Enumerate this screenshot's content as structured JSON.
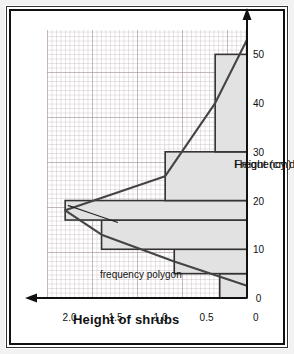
{
  "figure": {
    "title": "Height of shrubs",
    "annotation": "frequency polygon"
  },
  "chart_data": {
    "type": "bar",
    "title": "Height of shrubs",
    "xlabel": "Height (cm)",
    "ylabel": "Frequency density",
    "xlim": [
      0,
      55
    ],
    "ylim": [
      0,
      2.2
    ],
    "xticks": [
      "0",
      "10",
      "20",
      "30",
      "40",
      "50"
    ],
    "xtick_values": [
      0,
      10,
      20,
      30,
      40,
      50
    ],
    "yticks": [
      "0",
      "0.5",
      "1.0",
      "1.5",
      "2.0"
    ],
    "ytick_values": [
      0,
      0.5,
      1.0,
      1.5,
      2.0
    ],
    "grid": true,
    "orientation": "rotated-90-ccw",
    "bars": [
      {
        "label": "0-5",
        "x0": 0,
        "x1": 5,
        "value": 0.3
      },
      {
        "label": "5-10",
        "x0": 5,
        "x1": 10,
        "value": 0.8
      },
      {
        "label": "10-16",
        "x0": 10,
        "x1": 16,
        "value": 1.6
      },
      {
        "label": "16-20",
        "x0": 16,
        "x1": 20,
        "value": 2.0
      },
      {
        "label": "20-30",
        "x0": 20,
        "x1": 30,
        "value": 0.9
      },
      {
        "label": "30-50",
        "x0": 30,
        "x1": 50,
        "value": 0.35
      }
    ],
    "series": [
      {
        "name": "frequency polygon",
        "type": "line",
        "points": [
          {
            "x": 2.5,
            "y": 0.0
          },
          {
            "x": 7.5,
            "y": 0.8
          },
          {
            "x": 13.0,
            "y": 1.6
          },
          {
            "x": 18.0,
            "y": 2.0
          },
          {
            "x": 25.0,
            "y": 0.9
          },
          {
            "x": 40.0,
            "y": 0.35
          },
          {
            "x": 53.0,
            "y": 0.0
          }
        ]
      }
    ],
    "colors": {
      "bar_fill": "#e2e2e2",
      "bar_stroke": "#333333",
      "line": "#444444",
      "grid_major": "#aa969b",
      "grid_minor": "#beafb4",
      "axis": "#111111",
      "frame": "#111111"
    }
  }
}
